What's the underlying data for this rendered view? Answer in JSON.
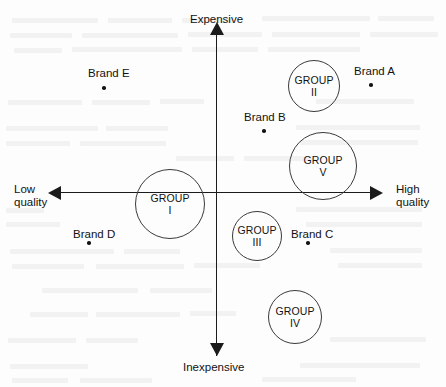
{
  "figure": {
    "kind": "perceptual-positioning-map"
  },
  "chart_data": {
    "type": "scatter",
    "title": "",
    "xlabel": "",
    "ylabel": "",
    "xlim": [
      -1,
      1
    ],
    "ylim": [
      -1,
      1
    ],
    "grid": false,
    "legend": "none",
    "axes": {
      "vertical": {
        "positive_label": "Expensive",
        "negative_label": "Inexpensive"
      },
      "horizontal": {
        "negative_label": "Low\nquality",
        "positive_label": "High\nquality"
      }
    },
    "brands": [
      {
        "name": "Brand E",
        "x": -0.72,
        "y": 0.67,
        "px": 104,
        "py": 88,
        "label_x": 88,
        "label_y": 67
      },
      {
        "name": "Brand A",
        "x": 0.98,
        "y": 0.68,
        "px": 371,
        "py": 85,
        "label_x": 354,
        "label_y": 65
      },
      {
        "name": "Brand B",
        "x": 0.3,
        "y": 0.38,
        "px": 264,
        "py": 131,
        "label_x": 244,
        "label_y": 111
      },
      {
        "name": "Brand D",
        "x": -0.81,
        "y": -0.32,
        "px": 89,
        "py": 243,
        "label_x": 73,
        "label_y": 228
      },
      {
        "name": "Brand C",
        "x": 0.58,
        "y": -0.32,
        "px": 308,
        "py": 243,
        "label_x": 291,
        "label_y": 228
      }
    ],
    "groups": [
      {
        "name": "GROUP",
        "roman": "I",
        "x": -0.29,
        "y": -0.07,
        "cx": 170,
        "cy": 204,
        "r": 35
      },
      {
        "name": "GROUP",
        "roman": "II",
        "x": 0.62,
        "y": 0.65,
        "cx": 314,
        "cy": 86,
        "r": 26
      },
      {
        "name": "GROUP",
        "roman": "III",
        "x": 0.26,
        "y": -0.27,
        "cx": 257,
        "cy": 236,
        "r": 25
      },
      {
        "name": "GROUP",
        "roman": "IV",
        "x": 0.49,
        "y": -0.77,
        "cx": 295,
        "cy": 317,
        "r": 27
      },
      {
        "name": "GROUP",
        "roman": "V",
        "x": 0.66,
        "y": 0.16,
        "cx": 323,
        "cy": 166,
        "r": 34
      }
    ]
  },
  "background": {
    "note": "faint scanner bleed-through from reverse page",
    "ghost_lines": [
      {
        "x": 12,
        "y": 18,
        "w": 86
      },
      {
        "x": 108,
        "y": 18,
        "w": 64
      },
      {
        "x": 182,
        "y": 18,
        "w": 52
      },
      {
        "x": 262,
        "y": 16,
        "w": 108
      },
      {
        "x": 378,
        "y": 16,
        "w": 56
      },
      {
        "x": 10,
        "y": 33,
        "w": 62
      },
      {
        "x": 82,
        "y": 33,
        "w": 96
      },
      {
        "x": 188,
        "y": 32,
        "w": 74
      },
      {
        "x": 272,
        "y": 32,
        "w": 88
      },
      {
        "x": 370,
        "y": 32,
        "w": 68
      },
      {
        "x": 14,
        "y": 48,
        "w": 48
      },
      {
        "x": 72,
        "y": 47,
        "w": 110
      },
      {
        "x": 192,
        "y": 47,
        "w": 66
      },
      {
        "x": 268,
        "y": 47,
        "w": 92
      },
      {
        "x": 8,
        "y": 100,
        "w": 74
      },
      {
        "x": 92,
        "y": 100,
        "w": 58
      },
      {
        "x": 160,
        "y": 99,
        "w": 44
      },
      {
        "x": 316,
        "y": 99,
        "w": 98
      },
      {
        "x": 6,
        "y": 126,
        "w": 92
      },
      {
        "x": 106,
        "y": 126,
        "w": 62
      },
      {
        "x": 296,
        "y": 125,
        "w": 124
      },
      {
        "x": 6,
        "y": 141,
        "w": 64
      },
      {
        "x": 80,
        "y": 141,
        "w": 86
      },
      {
        "x": 300,
        "y": 140,
        "w": 118
      },
      {
        "x": 176,
        "y": 156,
        "w": 58
      },
      {
        "x": 244,
        "y": 156,
        "w": 72
      },
      {
        "x": 6,
        "y": 208,
        "w": 38
      },
      {
        "x": 296,
        "y": 207,
        "w": 126
      },
      {
        "x": 6,
        "y": 222,
        "w": 54
      },
      {
        "x": 306,
        "y": 222,
        "w": 116
      },
      {
        "x": 10,
        "y": 249,
        "w": 104
      },
      {
        "x": 124,
        "y": 249,
        "w": 56
      },
      {
        "x": 330,
        "y": 248,
        "w": 92
      },
      {
        "x": 12,
        "y": 264,
        "w": 72
      },
      {
        "x": 96,
        "y": 264,
        "w": 88
      },
      {
        "x": 194,
        "y": 263,
        "w": 66
      },
      {
        "x": 338,
        "y": 263,
        "w": 84
      },
      {
        "x": 42,
        "y": 288,
        "w": 96
      },
      {
        "x": 150,
        "y": 288,
        "w": 62
      },
      {
        "x": 30,
        "y": 312,
        "w": 58
      },
      {
        "x": 96,
        "y": 312,
        "w": 84
      },
      {
        "x": 190,
        "y": 311,
        "w": 46
      },
      {
        "x": 8,
        "y": 338,
        "w": 68
      },
      {
        "x": 86,
        "y": 338,
        "w": 52
      },
      {
        "x": 330,
        "y": 337,
        "w": 96
      },
      {
        "x": 10,
        "y": 364,
        "w": 78
      },
      {
        "x": 300,
        "y": 363,
        "w": 120
      },
      {
        "x": 12,
        "y": 378,
        "w": 56
      },
      {
        "x": 80,
        "y": 378,
        "w": 72
      },
      {
        "x": 262,
        "y": 377,
        "w": 94
      }
    ]
  }
}
